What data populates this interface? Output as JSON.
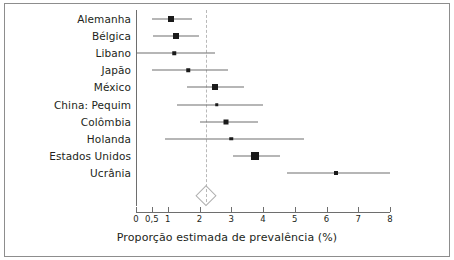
{
  "chart_data": {
    "type": "forest",
    "title": "",
    "xlabel": "Proporção estimada de prevalência (%)",
    "ylabel": "",
    "xlim": [
      0,
      8
    ],
    "grid": false,
    "legend": "none",
    "tick_values": [
      0,
      0.5,
      1,
      2,
      3,
      4,
      5,
      6,
      7,
      8
    ],
    "tick_labels": [
      "0",
      "0,5",
      "1",
      "2",
      "3",
      "4",
      "5",
      "6",
      "7",
      "8"
    ],
    "reference_line": 2.2,
    "categories": [
      "Alemanha",
      "Bélgica",
      "Libano",
      "Japão",
      "México",
      "China: Pequim",
      "Colômbia",
      "Holanda",
      "Estados Unidos",
      "Ucrânia"
    ],
    "values": [
      1.1,
      1.25,
      1.2,
      1.65,
      2.5,
      2.55,
      2.85,
      3.0,
      3.75,
      6.3
    ],
    "ci_low": [
      0.5,
      0.55,
      0.0,
      0.5,
      1.6,
      1.3,
      2.0,
      0.9,
      3.05,
      4.75
    ],
    "ci_high": [
      1.75,
      2.0,
      2.5,
      2.9,
      3.4,
      4.0,
      3.85,
      5.3,
      4.55,
      8.0
    ],
    "marker_sizes": [
      6,
      6,
      3.5,
      3.5,
      6,
      3.5,
      5,
      3.5,
      8,
      4
    ],
    "summary": {
      "label": "",
      "value": 2.2,
      "ci_low": 1.9,
      "ci_high": 2.5
    }
  },
  "colors": {
    "marker": "#1a1a1a",
    "line": "#6e6e6e",
    "reference": "#b9b9b9",
    "frame": "#8d8d8d",
    "text": "#231f20",
    "background": "#ffffff"
  }
}
